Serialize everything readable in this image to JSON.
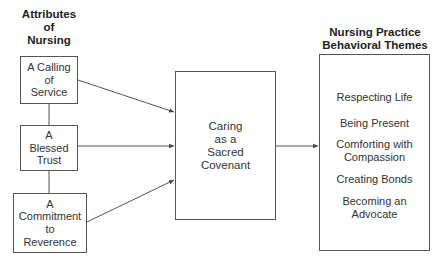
{
  "left_column": {
    "heading": "Attributes\nof\nNursing",
    "attributes": [
      {
        "label": "A Calling\nof\nService"
      },
      {
        "label": "A\nBlessed\nTrust"
      },
      {
        "label": "A\nCommitment\nto\nReverence"
      }
    ]
  },
  "center": {
    "label": "Caring\nas a\nSacred\nCovenant"
  },
  "right_column": {
    "heading": "Nursing Practice\nBehavioral Themes",
    "themes": [
      {
        "label": "Respecting Life"
      },
      {
        "label": "Being Present"
      },
      {
        "label": "Comforting with\nCompassion"
      },
      {
        "label": "Creating Bonds"
      },
      {
        "label": "Becoming an\nAdvocate"
      }
    ]
  },
  "colors": {
    "line": "#444444",
    "text": "#333333",
    "background": "#ffffff"
  }
}
